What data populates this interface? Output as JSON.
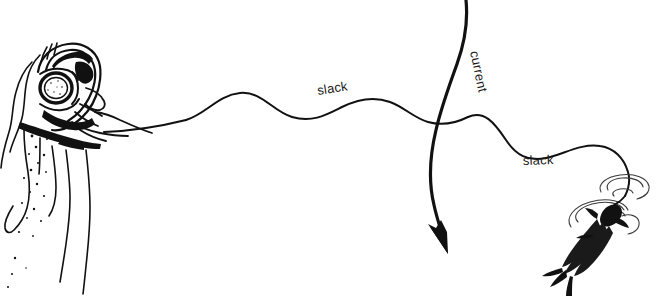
{
  "figure": {
    "background_color": "#ffffff",
    "ink_color": "#111111",
    "labels": {
      "slack_left": "slack",
      "slack_right": "slack",
      "current": "current"
    },
    "caption_cropped": "The background is white; the caption text is cut off at the bottom edge",
    "elements": {
      "diver": "diver-head-with-mask",
      "speargun_line": "fishing-line",
      "current_arrow": "downward-curved-arrow",
      "fish": "hooked-fish",
      "ripples": "water-ripples",
      "bubbles": "bubble-dots"
    }
  }
}
